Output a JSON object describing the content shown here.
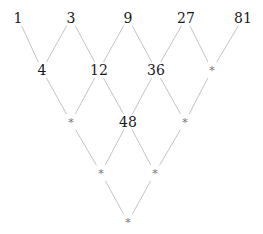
{
  "diagram": {
    "type": "lattice",
    "colors": {
      "number": "#1a1a1a",
      "placeholder": "#777777",
      "edge": "#c4c4c4"
    },
    "rows": [
      {
        "y": 18,
        "nodes": [
          {
            "x": 18,
            "label": "1"
          },
          {
            "x": 71,
            "label": "3"
          },
          {
            "x": 128,
            "label": "9"
          },
          {
            "x": 186,
            "label": "27"
          },
          {
            "x": 243,
            "label": "81"
          }
        ]
      },
      {
        "y": 70,
        "nodes": [
          {
            "x": 42,
            "label": "4"
          },
          {
            "x": 99,
            "label": "12"
          },
          {
            "x": 156,
            "label": "36"
          },
          {
            "x": 212,
            "label": "*"
          }
        ]
      },
      {
        "y": 122,
        "nodes": [
          {
            "x": 71,
            "label": "*"
          },
          {
            "x": 128,
            "label": "48"
          },
          {
            "x": 185,
            "label": "*"
          }
        ]
      },
      {
        "y": 173,
        "nodes": [
          {
            "x": 101,
            "label": "*"
          },
          {
            "x": 155,
            "label": "*"
          }
        ]
      },
      {
        "y": 222,
        "nodes": [
          {
            "x": 128,
            "label": "*"
          }
        ]
      }
    ]
  }
}
